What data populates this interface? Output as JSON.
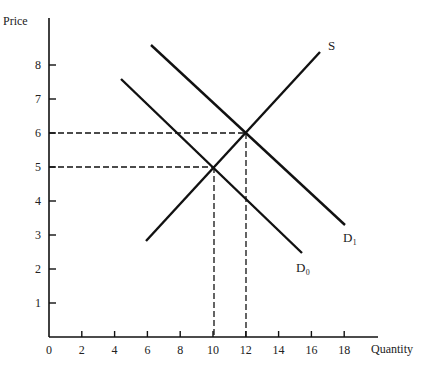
{
  "chart_data": {
    "type": "line",
    "title": "",
    "xlabel": "Quantity",
    "ylabel": "Price",
    "xlim": [
      0,
      20
    ],
    "ylim": [
      0,
      9
    ],
    "x_ticks": [
      "0",
      "2",
      "4",
      "6",
      "8",
      "10",
      "12",
      "14",
      "16",
      "18"
    ],
    "y_ticks": [
      "1",
      "2",
      "3",
      "4",
      "5",
      "6",
      "7",
      "8"
    ],
    "grid": false,
    "legend": "none (curves labeled inline)",
    "series": [
      {
        "name": "S",
        "label": "S",
        "points": [
          [
            6,
            2.8
          ],
          [
            16.5,
            8.4
          ]
        ]
      },
      {
        "name": "D0",
        "label": "D₀",
        "points": [
          [
            4.3,
            7.6
          ],
          [
            15.2,
            2.5
          ]
        ]
      },
      {
        "name": "D1",
        "label": "D₁",
        "points": [
          [
            6.2,
            8.6
          ],
          [
            18,
            3.3
          ]
        ]
      }
    ],
    "annotations": [
      {
        "type": "equilibrium",
        "curves": [
          "S",
          "D0"
        ],
        "x": 10,
        "y": 5,
        "dashed_guides": true
      },
      {
        "type": "equilibrium",
        "curves": [
          "S",
          "D1"
        ],
        "x": 12,
        "y": 6,
        "dashed_guides": true
      }
    ]
  },
  "labels": {
    "y_axis": "Price",
    "x_axis": "Quantity",
    "S": "S",
    "D0": "D₀",
    "D1": "D₁"
  }
}
